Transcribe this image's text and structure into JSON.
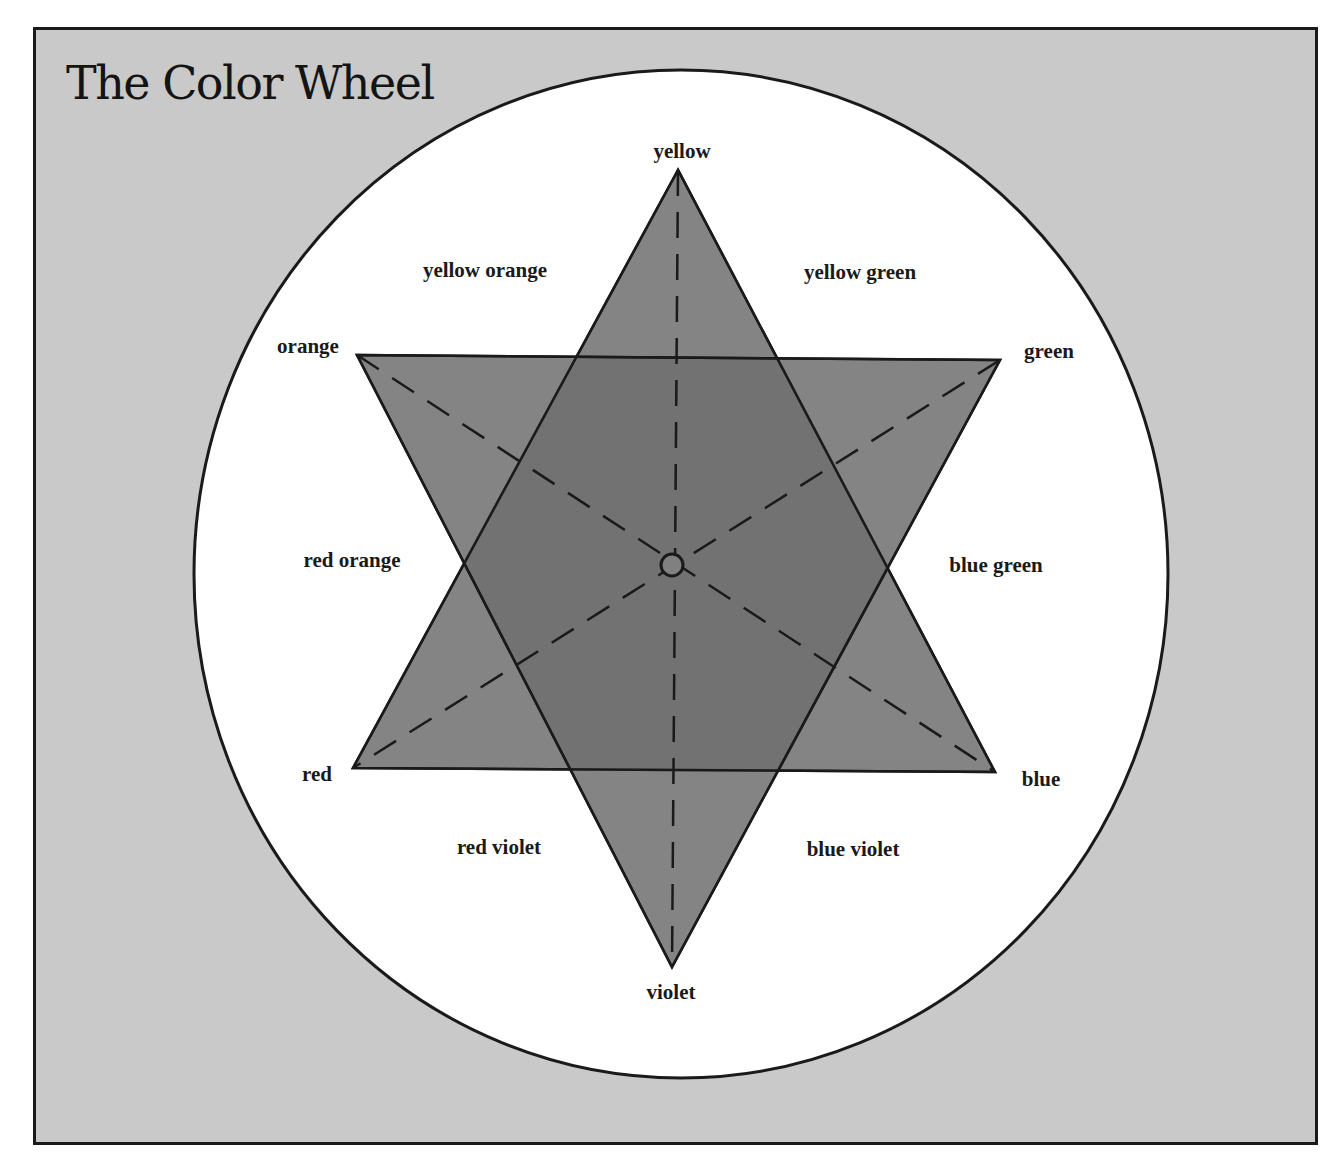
{
  "title": "The Color Wheel",
  "colors": {
    "background": "#c9c9c9",
    "wheel": "#ffffff",
    "star_fill": "#808080",
    "lines": "#1a1a1a"
  },
  "labels": {
    "yellow": "yellow",
    "yellow_orange": "yellow orange",
    "yellow_green": "yellow green",
    "orange": "orange",
    "green": "green",
    "red_orange": "red orange",
    "blue_green": "blue green",
    "red": "red",
    "blue": "blue",
    "red_violet": "red violet",
    "blue_violet": "blue violet",
    "violet": "violet"
  },
  "diagram": {
    "type": "color-wheel-star",
    "primary_triangle": [
      "yellow",
      "red",
      "blue"
    ],
    "secondary_triangle": [
      "orange",
      "green",
      "violet"
    ],
    "tertiary": [
      "yellow orange",
      "yellow green",
      "blue green",
      "blue violet",
      "red violet",
      "red orange"
    ],
    "complement_axes": [
      [
        "yellow",
        "violet"
      ],
      [
        "orange",
        "blue"
      ],
      [
        "green",
        "red"
      ]
    ]
  }
}
